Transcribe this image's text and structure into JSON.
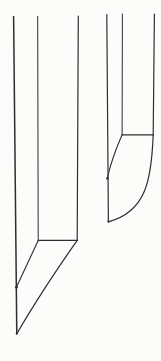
{
  "illustration": {
    "description": "line-art engraving of two pointed blade-nib shapes",
    "canvas": {
      "width": 161,
      "height": 361,
      "background": "#fcfcfa"
    },
    "stroke": {
      "color": "#2e2e2e",
      "default_width": 1.1
    },
    "shapes": [
      {
        "name": "large-blade-left",
        "paths": [
          {
            "name": "large-blade-spine-line",
            "d": "M 13.6 16.5 L 16.8 333.8",
            "w": 1.5
          },
          {
            "name": "large-blade-inner-face-line",
            "d": "M 37.7 16.5 L 38.2 240.4",
            "w": 1.0
          },
          {
            "name": "large-blade-outer-face-line",
            "d": "M 78.3 16.0 L 77.2 240.4",
            "w": 1.2
          },
          {
            "name": "large-blade-shoulder-line",
            "d": "M 38.2 240.4 L 77.2 240.4",
            "w": 1.3
          },
          {
            "name": "large-blade-inner-bevel-line",
            "d": "M 38.2 240.4 L 16.4 287.3",
            "w": 1.1
          },
          {
            "name": "large-blade-edge-curve",
            "d": "M 77.2 240.4 Q 41 292 16.8 333.8",
            "w": 1.2
          }
        ],
        "dots": [
          {
            "name": "large-blade-joint-dot",
            "cx": 16.4,
            "cy": 287.3,
            "r": 1.4
          },
          {
            "name": "large-blade-tip-dot",
            "cx": 16.8,
            "cy": 333.4,
            "r": 1.1
          }
        ]
      },
      {
        "name": "small-blade-right",
        "paths": [
          {
            "name": "small-blade-spine-line",
            "d": "M 106.8 14.5 L 108.4 221.8",
            "w": 1.2
          },
          {
            "name": "small-blade-inner-face-line",
            "d": "M 122.4 14.0 L 122.1 134.8",
            "w": 1.0
          },
          {
            "name": "small-blade-outer-face-line",
            "d": "M 154.4 14.0 L 153.2 134.8",
            "w": 1.2
          },
          {
            "name": "small-blade-shoulder-line",
            "d": "M 122.1 134.8 L 153.2 134.8",
            "w": 1.3
          },
          {
            "name": "small-blade-inner-bevel-line",
            "d": "M 122.1 134.8 Q 111.5 159 107.3 178.5",
            "w": 1.1
          },
          {
            "name": "small-blade-edge-curve",
            "d": "M 153.2 134.8 C 151.5 180 146 212 108.4 221.8",
            "w": 1.2
          }
        ],
        "dots": [
          {
            "name": "small-blade-joint-dot",
            "cx": 107.3,
            "cy": 178.5,
            "r": 1.2
          },
          {
            "name": "small-blade-tip-dot",
            "cx": 108.4,
            "cy": 221.4,
            "r": 1.0
          }
        ]
      }
    ]
  }
}
